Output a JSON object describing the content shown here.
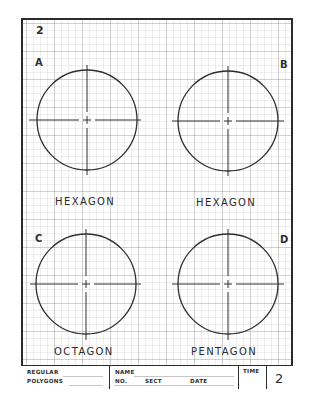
{
  "sheet": {
    "number": "2",
    "grid": {
      "major_spacing_px": 28,
      "minor_spacing_px": 7,
      "line_color": "#bdbdbd"
    },
    "border_color": "#2b2b2b"
  },
  "problems": [
    {
      "letter": "A",
      "shape": "HEXAGON",
      "circle": {
        "cx": 87,
        "cy": 120,
        "r": 50
      }
    },
    {
      "letter": "B",
      "shape": "HEXAGON",
      "circle": {
        "cx": 228,
        "cy": 121,
        "r": 50
      }
    },
    {
      "letter": "C",
      "shape": "OCTAGON",
      "circle": {
        "cx": 86,
        "cy": 284,
        "r": 50
      }
    },
    {
      "letter": "D",
      "shape": "PENTAGON",
      "circle": {
        "cx": 228,
        "cy": 284,
        "r": 50
      }
    }
  ],
  "title_block": {
    "title_line1": "REGULAR",
    "title_line2": "POLYGONS",
    "name_label": "NAME",
    "no_label": "NO.",
    "sect_label": "SECT",
    "date_label": "DATE",
    "time_label": "TIME",
    "sheet_number": "2"
  }
}
